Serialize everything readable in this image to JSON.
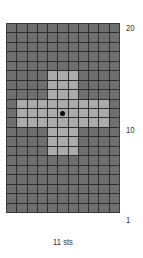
{
  "chart_data": {
    "type": "heatmap",
    "title": "",
    "columns": 11,
    "rows": 20,
    "xlabel": "11 sts",
    "row_tick_labels": [
      {
        "row": 20,
        "label": "20"
      },
      {
        "row": 10,
        "label": "10"
      },
      {
        "row": 1,
        "label": "1"
      }
    ],
    "colors": {
      "background_cell": "#6f6f6f",
      "contrast_cell": "#acacac",
      "grid_line": "#2e2e2e",
      "center_dot": "#000000"
    },
    "pattern_description": "Light-colored plus/cross motif centered on dark background",
    "light_cells_rows_from_top": {
      "5": [
        4,
        5,
        6
      ],
      "6": [
        4,
        5,
        6
      ],
      "7": [
        4,
        5,
        6
      ],
      "8": [
        1,
        2,
        3,
        4,
        5,
        6,
        7,
        8,
        9
      ],
      "9": [
        1,
        2,
        3,
        4,
        5,
        6,
        7,
        8,
        9
      ],
      "10": [
        1,
        2,
        3,
        4,
        5,
        6,
        7,
        8,
        9
      ],
      "11": [
        4,
        5,
        6
      ],
      "12": [
        4,
        5,
        6
      ],
      "13": [
        4,
        5,
        6
      ]
    },
    "center_marker": {
      "row_from_top": 9,
      "col": 5
    }
  },
  "labels": {
    "row_20": "20",
    "row_10": "10",
    "row_1": "1",
    "stitches": "11 sts"
  }
}
